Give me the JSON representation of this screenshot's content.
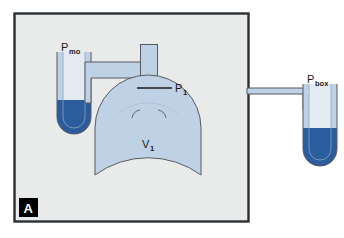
{
  "figure": {
    "panel_letter": "A",
    "labels": {
      "mouth_pressure": {
        "symbol": "P",
        "subscript": "mo"
      },
      "alveolar_pressure": {
        "symbol": "P",
        "subscript": "1"
      },
      "lung_volume": {
        "symbol": "V",
        "subscript": "1"
      },
      "box_pressure": {
        "symbol": "P",
        "subscript": "box"
      }
    },
    "colors": {
      "page_background": "#ffffff",
      "panel_background": "#e9eaea",
      "panel_border": "#2b2f33",
      "gas_fill": "#bfd2e5",
      "mercury_fill": "#2a5c9e",
      "tube_outline": "#555b61",
      "label_text": "#1a1a1a",
      "panel_letter_background": "#000000",
      "panel_letter_text": "#ffffff"
    },
    "geometry": {
      "panel": {
        "x": 14,
        "y": 13,
        "width": 235,
        "height": 209
      },
      "left_manometer": {
        "x": 57,
        "y": 52,
        "width": 34,
        "height": 82
      },
      "right_manometer": {
        "x": 303,
        "y": 84,
        "width": 34,
        "height": 82
      },
      "bell_jar": {
        "cx": 148,
        "cy": 104,
        "width": 106,
        "height": 76
      },
      "neck_tube": {
        "x": 140,
        "y": 44,
        "width": 17,
        "height": 62
      }
    }
  }
}
